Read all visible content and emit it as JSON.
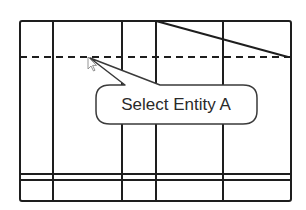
{
  "diagram": {
    "callout": {
      "label": "Select Entity A"
    },
    "colors": {
      "stroke": "#1e1e1e",
      "background": "#ffffff",
      "callout_fill": "#ffffff",
      "callout_stroke": "#3a3a3a",
      "cursor_fill": "#ffffff",
      "cursor_stroke": "#888888"
    },
    "frame": {
      "left": 20,
      "right": 291,
      "top": 21,
      "bottom": 201
    },
    "vertical_lines_x": [
      53,
      122,
      156,
      223
    ],
    "dashed_line_y": 57,
    "double_lines_y": [
      174,
      180
    ],
    "diagonal": {
      "from": [
        156,
        21
      ],
      "to": [
        288,
        57
      ]
    },
    "cursor": {
      "x": 88,
      "y": 57,
      "icon": "arrow-cursor-icon"
    }
  }
}
